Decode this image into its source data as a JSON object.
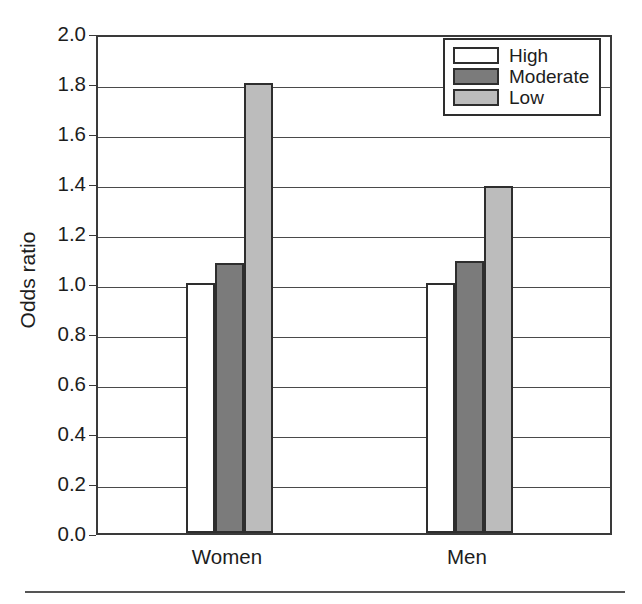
{
  "chart_data": {
    "type": "bar",
    "title": "",
    "xlabel": "",
    "ylabel": "Odds ratio",
    "categories": [
      "Women",
      "Men"
    ],
    "series": [
      {
        "name": "High",
        "values": [
          1.0,
          1.0
        ],
        "color": "#ffffff"
      },
      {
        "name": "Moderate",
        "values": [
          1.08,
          1.09
        ],
        "color": "#7b7b7b"
      },
      {
        "name": "Low",
        "values": [
          1.8,
          1.39
        ],
        "color": "#bcbcbc"
      }
    ],
    "ylim": [
      0.0,
      2.0
    ],
    "ytick_labels": [
      "2.0",
      "1.8",
      "1.6",
      "1.4",
      "1.2",
      "1.0",
      "0.8",
      "0.6",
      "0.4",
      "0.2",
      "0.0"
    ],
    "ytick_values": [
      2.0,
      1.8,
      1.6,
      1.4,
      1.2,
      1.0,
      0.8,
      0.6,
      0.4,
      0.2,
      0.0
    ],
    "grid": true,
    "legend_position": "top-right"
  },
  "axis": {
    "y_label": "Odds ratio",
    "y_ticks": [
      "2.0",
      "1.8",
      "1.6",
      "1.4",
      "1.2",
      "1.0",
      "0.8",
      "0.6",
      "0.4",
      "0.2",
      "0.0"
    ],
    "x_ticks": [
      "Women",
      "Men"
    ]
  },
  "legend": {
    "entries": [
      {
        "label": "High"
      },
      {
        "label": "Moderate"
      },
      {
        "label": "Low"
      }
    ]
  }
}
